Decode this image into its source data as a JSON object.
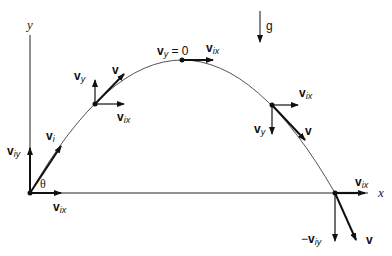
{
  "diagram": {
    "axes": {
      "x_label": "x",
      "y_label": "y"
    },
    "gravity_label": "g",
    "angle_label": "θ",
    "points": {
      "launch": {
        "v_initial": {
          "main": "v",
          "sub": "i"
        },
        "v_initial_y": {
          "main": "v",
          "sub": "iy"
        },
        "v_initial_x": {
          "main": "v",
          "sub": "ix"
        }
      },
      "rising": {
        "v": {
          "main": "v"
        },
        "v_y": {
          "main": "v",
          "sub": "y"
        },
        "v_x": {
          "main": "v",
          "sub": "ix"
        }
      },
      "peak": {
        "v_y_zero": {
          "main": "v",
          "sub": "y",
          "suffix": " = 0"
        },
        "v_x": {
          "main": "v",
          "sub": "ix"
        }
      },
      "falling": {
        "v": {
          "main": "v"
        },
        "v_y": {
          "main": "v",
          "sub": "y"
        },
        "v_x": {
          "main": "v",
          "sub": "ix"
        }
      },
      "landing": {
        "v": {
          "main": "v"
        },
        "v_y": {
          "prefix": "−",
          "main": "v",
          "sub": "iy"
        },
        "v_x": {
          "main": "v",
          "sub": "ix"
        }
      }
    }
  }
}
